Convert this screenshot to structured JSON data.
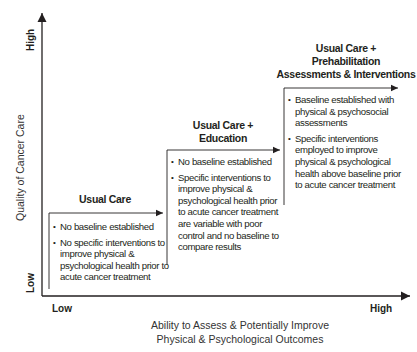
{
  "axes": {
    "y_title": "Quality of Cancer Care",
    "y_low": "Low",
    "y_high": "High",
    "x_title_line1": "Ability to Assess & Potentially Improve",
    "x_title_line2": "Physical & Psychological Outcomes",
    "x_low": "Low",
    "x_high": "High"
  },
  "steps": [
    {
      "title_lines": [
        "Usual Care"
      ],
      "bullets": [
        "No baseline established",
        "No specific interventions to improve physical & psychological health prior to acute cancer treatment"
      ]
    },
    {
      "title_lines": [
        "Usual Care +",
        "Education"
      ],
      "bullets": [
        "No baseline established",
        "Specific interventions to improve physical & psychological health prior to acute cancer treatment are variable with poor control and no baseline to compare results"
      ]
    },
    {
      "title_lines": [
        "Usual Care +",
        "Prehabilitation",
        "Assessments & Interventions"
      ],
      "bullets": [
        "Baseline established with physical & psychosocial assessments",
        "Specific interventions employed to improve physical & psychological health above baseline prior to acute cancer treatment"
      ]
    }
  ],
  "colors": {
    "line": "#231f20",
    "text": "#231f20"
  }
}
